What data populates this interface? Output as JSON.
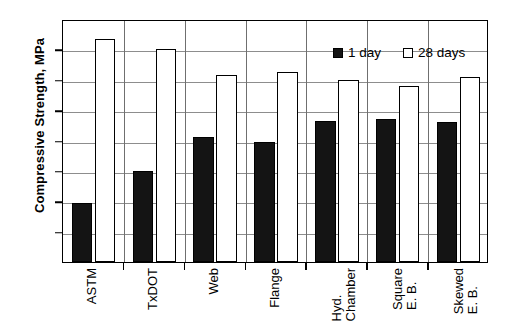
{
  "chart_data": {
    "type": "bar",
    "title": "",
    "xlabel": "",
    "ylabel": "Compressive Strength, MPa",
    "ylim": [
      30,
      110
    ],
    "ytick_step": 10,
    "yticks": [
      110,
      100,
      90,
      80,
      70,
      60,
      50,
      40,
      30
    ],
    "grid": true,
    "legend_position": "top-right-inside",
    "categories": [
      "ASTM",
      "TxDOT",
      "Web",
      "Flange",
      "Hyd. Chamber",
      "Square E. B.",
      "Skewed E. B."
    ],
    "category_lines": [
      [
        "ASTM"
      ],
      [
        "TxDOT"
      ],
      [
        "Web"
      ],
      [
        "Flange"
      ],
      [
        "Hyd.",
        "Chamber"
      ],
      [
        "Square",
        "E. B."
      ],
      [
        "Skewed",
        "E. B."
      ]
    ],
    "series": [
      {
        "name": "1 day",
        "color": "#141414",
        "style": "filled",
        "values": [
          49.5,
          60.0,
          71.0,
          69.5,
          76.5,
          77.0,
          76.0
        ]
      },
      {
        "name": "28 days",
        "color": "#ffffff",
        "style": "open",
        "values": [
          103.5,
          100.0,
          91.5,
          92.5,
          90.0,
          88.0,
          91.0
        ]
      }
    ]
  },
  "axis": {
    "y_title": "Compressive Strength, MPa"
  },
  "legend": {
    "items": [
      {
        "label": "1 day"
      },
      {
        "label": "28 days"
      }
    ]
  },
  "colors": {
    "bar_filled": "#141414",
    "bar_open": "#ffffff",
    "axis": "#000000",
    "gridline": "#8d8d8d",
    "background": "#ffffff"
  }
}
